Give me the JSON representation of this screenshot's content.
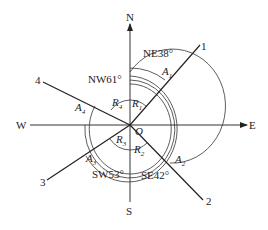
{
  "figure": {
    "compass": {
      "north": "N",
      "south": "S",
      "east": "E",
      "west": "W",
      "origin": "O"
    },
    "lines": [
      {
        "id": "1",
        "bearing_label": "NE38°",
        "angle_label": "A",
        "angle_sub": "1",
        "reduced_label": "R",
        "reduced_sub": "1"
      },
      {
        "id": "2",
        "bearing_label": "SE42°",
        "angle_label": "A",
        "angle_sub": "2",
        "reduced_label": "R",
        "reduced_sub": "2"
      },
      {
        "id": "3",
        "bearing_label": "SW53°",
        "angle_label": "A",
        "angle_sub": "3",
        "reduced_label": "R",
        "reduced_sub": "3"
      },
      {
        "id": "4",
        "bearing_label": "NW61°",
        "angle_label": "A",
        "angle_sub": "4",
        "reduced_label": "R",
        "reduced_sub": "4"
      }
    ]
  }
}
